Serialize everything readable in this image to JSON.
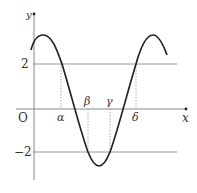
{
  "figure": {
    "axes": {
      "x_label": "x",
      "y_label": "y",
      "origin_label": "O"
    },
    "y_ticks": [
      {
        "value": 2,
        "label": "2"
      },
      {
        "value": -2,
        "label": "−2"
      }
    ],
    "x_points": [
      {
        "name": "alpha",
        "label": "α"
      },
      {
        "name": "beta",
        "label": "β"
      },
      {
        "name": "gamma",
        "label": "γ"
      },
      {
        "name": "delta",
        "label": "δ"
      }
    ],
    "horizontal_lines": [
      "y = 2",
      "y = -2"
    ],
    "curve": "sinusoidal curve with maxima above y=2 and minimum below y=-2",
    "colors": {
      "curve": "#222222",
      "axes": "#888888",
      "guide_lines": "#999999",
      "dotted": "#aaaaaa"
    }
  }
}
